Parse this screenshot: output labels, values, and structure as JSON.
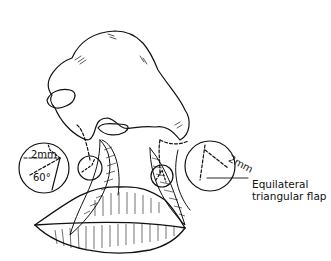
{
  "figure": {
    "labels": {
      "left_measure": "2mm",
      "left_angle": "60°",
      "right_measure": "2mm",
      "callout_line1": "Equilateral",
      "callout_line2": "triangular flap"
    },
    "colors": {
      "ink": "#111111",
      "background": "#ffffff"
    }
  }
}
